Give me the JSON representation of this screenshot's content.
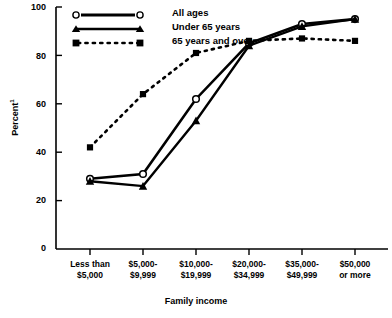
{
  "chart_data": {
    "type": "line",
    "title": "",
    "xlabel": "Family income",
    "ylabel": "Percent",
    "ylabel_superscript": "1",
    "ylim": [
      0,
      100
    ],
    "yticks": [
      0,
      20,
      40,
      60,
      80,
      100
    ],
    "grid": false,
    "legend_position": "top-left-inside",
    "categories": [
      "Less than\n$5,000",
      "$5,000-\n$9,999",
      "$10,000-\n$19,999",
      "$20,000-\n$34,999",
      "$35,000-\n$49,999",
      "$50,000\nor more"
    ],
    "category_lines": [
      [
        "Less than",
        "$5,000"
      ],
      [
        "$5,000-",
        "$9,999"
      ],
      [
        "$10,000-",
        "$19,999"
      ],
      [
        "$20,000-",
        "$34,999"
      ],
      [
        "$35,000-",
        "$49,999"
      ],
      [
        "$50,000",
        "or more"
      ]
    ],
    "series": [
      {
        "name": "All ages",
        "marker": "circle-open",
        "line": "solid",
        "values": [
          29,
          31,
          62,
          85,
          93,
          95
        ]
      },
      {
        "name": "Under 65 years",
        "marker": "triangle-filled",
        "line": "solid",
        "values": [
          28,
          26,
          53,
          84,
          92,
          95
        ]
      },
      {
        "name": "65 years and over",
        "marker": "square-filled",
        "line": "dotted",
        "values": [
          42,
          64,
          81,
          86,
          87,
          86
        ]
      }
    ]
  },
  "legend": {
    "items": [
      {
        "label": "All ages",
        "marker": "circle-open",
        "line": "solid"
      },
      {
        "label": "Under 65 years",
        "marker": "triangle-filled",
        "line": "solid"
      },
      {
        "label": "65 years and over",
        "marker": "square-filled",
        "line": "dotted"
      }
    ]
  },
  "axis": {
    "y_tick_labels": [
      "100",
      "80",
      "60",
      "40",
      "20",
      "0"
    ],
    "y_label_text": "Percent",
    "y_label_sup": "1",
    "x_axis_title": "Family income"
  },
  "colors": {
    "ink": "#000000",
    "background": "#ffffff"
  }
}
